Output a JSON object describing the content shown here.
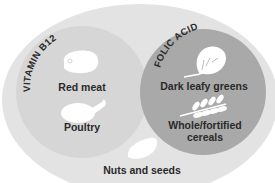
{
  "diagram": {
    "type": "venn",
    "outer": {
      "label": "",
      "color": "#e3e3e3",
      "items": [
        {
          "label": "Nuts and seeds",
          "icon": "nut-icon"
        }
      ]
    },
    "vitamin_b12": {
      "label": "VITAMIN B12",
      "color": "#d6d6d6",
      "items": [
        {
          "label": "Red meat",
          "icon": "steak-icon"
        },
        {
          "label": "Poultry",
          "icon": "drumstick-icon"
        }
      ]
    },
    "folic_acid": {
      "label": "FOLIC ACID",
      "color": "#a9a9a9",
      "items": [
        {
          "label": "Dark leafy greens",
          "icon": "leaf-icon"
        },
        {
          "label": "Whole/fortified",
          "label_line2": "cereals",
          "icon": "wheat-icon"
        }
      ]
    },
    "text_color": "#2a2a2a",
    "icon_color": "#ffffff"
  }
}
